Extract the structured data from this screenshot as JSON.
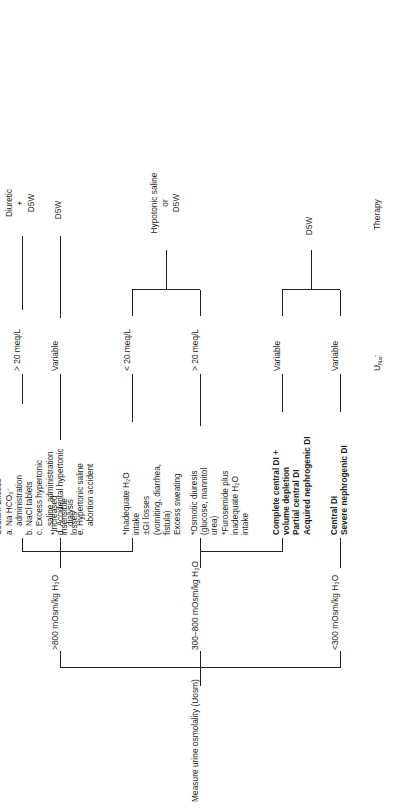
{
  "figure": {
    "title": "Measure urine osmolality (Uosm)",
    "orientation": "rotated-90-ccw"
  },
  "branches": {
    "low": "<300 mOsm/kg H₂O",
    "mid": "300–800 mOsm/kg H₂O",
    "high": ">800 mOsm/kg H₂O"
  },
  "nodes": {
    "low_causes": "Central DI\nSevere nephrogenic DI",
    "mid_di_causes": "Complete central DI +\n  volume depletion\nPartial central DI\nAcquired nephrogenic DI",
    "mid_osmotic_causes": "*Osmotic diuresis\n  (glucose, mannitol\n  urea)\n*Furosemide plus\n  inadequate H₂O\n  intake",
    "high_water_loss": "*Inadequate H₂O\n  intake\n±GI losses\n  (vomiting, diarrhea,\n  fistula)\nExcess sweating",
    "high_insensible": "*Increased\n  insensible\n  losses",
    "sodium_excess": {
      "heading": "Sodium Excess",
      "items": [
        "a. Na HCO₃⁻\n    administration",
        "b. NaCl tablets",
        "c. Excess hypertonic\n    saline administration",
        "d. Accidental hypertonic\n    dialysis",
        "e. Hypertonic saline\n    abortion accident"
      ]
    }
  },
  "rows": {
    "una_label": "U",
    "una_label_sub": "Na",
    "una_label_colon": ":",
    "therapy_label": "Therapy"
  },
  "una_values": {
    "low": "Variable",
    "mid_di": "Variable",
    "mid_osmotic": "> 20 meq/L",
    "high_water_loss": "< 20 meq/L",
    "high_insensible": "Variable",
    "sodium_excess": "> 20 meq/L"
  },
  "therapy_values": {
    "low_group": "D5W",
    "mid_high_group": "Hypotonic saline\nor\nD5W",
    "insensible": "D5W",
    "sodium_excess": "Diuretic\n+\nD5W"
  },
  "colors": {
    "ink": "#231f20",
    "paper": "#ffffff"
  }
}
